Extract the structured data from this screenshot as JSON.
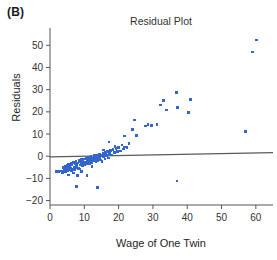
{
  "panel": {
    "label": "(B)"
  },
  "chart_data": {
    "type": "scatter",
    "title": "Residual Plot",
    "xlabel": "Wage of One Twin",
    "ylabel": "Residuals",
    "xlim": [
      0,
      65
    ],
    "ylim": [
      -22,
      56
    ],
    "xticks": [
      0,
      10,
      20,
      30,
      40,
      50,
      60
    ],
    "xtick_labels": [
      "0",
      "10",
      "20",
      "30",
      "40",
      "50",
      "60"
    ],
    "yticks": [
      -20,
      -10,
      0,
      10,
      20,
      30,
      40,
      50
    ],
    "ytick_labels": [
      "−20",
      "−10",
      "0",
      "10",
      "20",
      "30",
      "40",
      "50"
    ],
    "grid": false,
    "legend": null,
    "point_color": "#3366cc",
    "point_size": 2.6,
    "reference_line": {
      "name": "zero-residual-line",
      "color": "#5a5a5a",
      "x": [
        0,
        65
      ],
      "y": [
        -0.3,
        1.6
      ]
    },
    "x": [
      1.8,
      2.4,
      3.3,
      3.6,
      4.0,
      4.2,
      4.4,
      4.6,
      4.8,
      5.0,
      5.1,
      5.3,
      5.4,
      5.6,
      5.8,
      6.0,
      6.1,
      6.3,
      6.4,
      6.6,
      6.8,
      7.0,
      7.1,
      7.3,
      7.5,
      7.6,
      7.8,
      8.0,
      8.1,
      8.3,
      8.5,
      8.7,
      8.9,
      9.0,
      9.2,
      9.4,
      9.6,
      9.8,
      10.0,
      10.2,
      10.4,
      10.6,
      10.8,
      11.0,
      11.2,
      11.4,
      11.6,
      11.8,
      12.0,
      12.2,
      12.4,
      12.6,
      12.8,
      13.0,
      13.2,
      13.4,
      13.6,
      13.8,
      14.0,
      14.2,
      14.4,
      14.6,
      14.8,
      15.0,
      15.2,
      15.4,
      15.6,
      15.8,
      16.0,
      16.2,
      16.5,
      16.8,
      17.0,
      17.3,
      17.6,
      18.0,
      18.4,
      18.8,
      19.2,
      19.6,
      20.0,
      20.5,
      21.0,
      21.4,
      21.8,
      22.0,
      22.4,
      24.0,
      24.6,
      25.2,
      27.8,
      28.6,
      29.6,
      31.2,
      32.2,
      33.0,
      34.0,
      36.8,
      37.0,
      37.2,
      40.4,
      41.0,
      57.0,
      59.0,
      60.2,
      7.8,
      10.8,
      13.8,
      5.4,
      6.8,
      9.2,
      12.2,
      15.6,
      19.0,
      21.6,
      23.0,
      8.6,
      11.6,
      14.4,
      17.2
    ],
    "y": [
      -6.8,
      -6.9,
      -6.6,
      -7.4,
      -5.2,
      -6.2,
      -4.6,
      -7.0,
      -5.6,
      -4.2,
      -6.4,
      -5.0,
      -3.8,
      -6.0,
      -4.4,
      -5.4,
      -3.2,
      -6.6,
      -4.0,
      -5.8,
      -2.8,
      -4.8,
      -6.2,
      -3.4,
      -5.2,
      -2.4,
      -4.2,
      -8.8,
      -3.0,
      -5.6,
      -2.0,
      -4.0,
      -2.6,
      -3.6,
      -1.6,
      -4.4,
      -2.2,
      -3.2,
      -1.2,
      -3.8,
      -2.6,
      -1.0,
      -3.4,
      -2.0,
      -0.6,
      -3.0,
      -1.4,
      -2.4,
      -0.2,
      -2.8,
      -1.0,
      -2.2,
      0.2,
      -1.8,
      -0.6,
      -2.6,
      0.6,
      -1.4,
      -2.0,
      0.0,
      -1.0,
      1.0,
      -1.8,
      0.4,
      -2.4,
      1.4,
      -0.4,
      0.8,
      -1.2,
      1.8,
      0.2,
      2.2,
      -0.8,
      1.2,
      2.6,
      0.6,
      3.0,
      1.6,
      3.4,
      2.0,
      4.0,
      2.4,
      5.0,
      3.2,
      9.2,
      4.2,
      4.0,
      12.0,
      16.4,
      9.4,
      13.6,
      14.4,
      13.8,
      14.2,
      23.0,
      25.2,
      20.8,
      28.8,
      -11.2,
      22.0,
      19.6,
      25.6,
      11.2,
      47.0,
      52.4,
      -13.6,
      -8.8,
      -14.0,
      -8.4,
      -7.6,
      -6.8,
      -4.6,
      2.8,
      4.4,
      4.2,
      5.6,
      -5.8,
      -3.2,
      0.8,
      6.4
    ]
  }
}
